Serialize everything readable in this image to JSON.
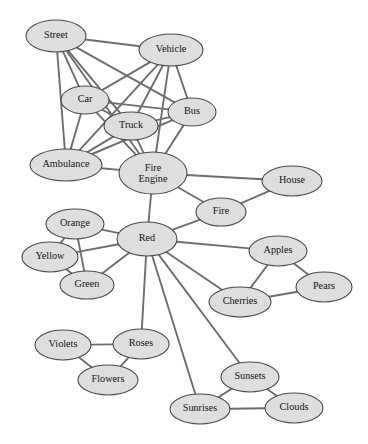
{
  "diagram": {
    "type": "semantic-network-graph",
    "style": {
      "node_fill": "#dedede",
      "node_stroke": "#4a4a4a",
      "edge_color": "#6d6d6d",
      "label_color": "#141414",
      "background": "#ffffff"
    },
    "nodes": [
      {
        "id": "street",
        "label": "Street",
        "x": 56,
        "y": 36,
        "rx": 30,
        "ry": 16
      },
      {
        "id": "vehicle",
        "label": "Vehicle",
        "x": 171,
        "y": 50,
        "rx": 32,
        "ry": 16
      },
      {
        "id": "car",
        "label": "Car",
        "x": 85,
        "y": 100,
        "rx": 24,
        "ry": 14
      },
      {
        "id": "bus",
        "label": "Bus",
        "x": 192,
        "y": 112,
        "rx": 24,
        "ry": 14
      },
      {
        "id": "truck",
        "label": "Truck",
        "x": 131,
        "y": 126,
        "rx": 27,
        "ry": 14
      },
      {
        "id": "ambulance",
        "label": "Ambulance",
        "x": 66,
        "y": 165,
        "rx": 36,
        "ry": 16
      },
      {
        "id": "fire-engine",
        "label": "Fire Engine",
        "x": 153,
        "y": 173,
        "rx": 34,
        "ry": 21
      },
      {
        "id": "house",
        "label": "House",
        "x": 292,
        "y": 181,
        "rx": 30,
        "ry": 15
      },
      {
        "id": "fire",
        "label": "Fire",
        "x": 221,
        "y": 212,
        "rx": 25,
        "ry": 14
      },
      {
        "id": "orange",
        "label": "Orange",
        "x": 75,
        "y": 224,
        "rx": 29,
        "ry": 15
      },
      {
        "id": "red",
        "label": "Red",
        "x": 147,
        "y": 239,
        "rx": 30,
        "ry": 17
      },
      {
        "id": "yellow",
        "label": "Yellow",
        "x": 50,
        "y": 257,
        "rx": 28,
        "ry": 15
      },
      {
        "id": "apples",
        "label": "Apples",
        "x": 278,
        "y": 251,
        "rx": 29,
        "ry": 15
      },
      {
        "id": "green",
        "label": "Green",
        "x": 87,
        "y": 285,
        "rx": 27,
        "ry": 14
      },
      {
        "id": "pears",
        "label": "Pears",
        "x": 324,
        "y": 287,
        "rx": 28,
        "ry": 15
      },
      {
        "id": "cherries",
        "label": "Cherries",
        "x": 240,
        "y": 302,
        "rx": 31,
        "ry": 15
      },
      {
        "id": "violets",
        "label": "Violets",
        "x": 63,
        "y": 345,
        "rx": 28,
        "ry": 15
      },
      {
        "id": "roses",
        "label": "Roses",
        "x": 141,
        "y": 344,
        "rx": 28,
        "ry": 15
      },
      {
        "id": "flowers",
        "label": "Flowers",
        "x": 108,
        "y": 380,
        "rx": 30,
        "ry": 15
      },
      {
        "id": "sunsets",
        "label": "Sunsets",
        "x": 250,
        "y": 377,
        "rx": 29,
        "ry": 15
      },
      {
        "id": "sunrises",
        "label": "Sunrises",
        "x": 200,
        "y": 409,
        "rx": 30,
        "ry": 15
      },
      {
        "id": "clouds",
        "label": "Clouds",
        "x": 294,
        "y": 408,
        "rx": 29,
        "ry": 15
      }
    ],
    "edges": [
      {
        "from": "street",
        "to": "vehicle"
      },
      {
        "from": "street",
        "to": "car"
      },
      {
        "from": "street",
        "to": "truck"
      },
      {
        "from": "street",
        "to": "bus"
      },
      {
        "from": "street",
        "to": "ambulance"
      },
      {
        "from": "street",
        "to": "fire-engine"
      },
      {
        "from": "vehicle",
        "to": "car"
      },
      {
        "from": "vehicle",
        "to": "truck"
      },
      {
        "from": "vehicle",
        "to": "bus"
      },
      {
        "from": "vehicle",
        "to": "ambulance"
      },
      {
        "from": "vehicle",
        "to": "fire-engine"
      },
      {
        "from": "car",
        "to": "bus"
      },
      {
        "from": "car",
        "to": "truck"
      },
      {
        "from": "car",
        "to": "ambulance"
      },
      {
        "from": "car",
        "to": "fire-engine"
      },
      {
        "from": "truck",
        "to": "bus"
      },
      {
        "from": "truck",
        "to": "ambulance"
      },
      {
        "from": "truck",
        "to": "fire-engine"
      },
      {
        "from": "bus",
        "to": "ambulance"
      },
      {
        "from": "bus",
        "to": "fire-engine"
      },
      {
        "from": "ambulance",
        "to": "fire-engine"
      },
      {
        "from": "fire-engine",
        "to": "house"
      },
      {
        "from": "fire-engine",
        "to": "fire"
      },
      {
        "from": "fire-engine",
        "to": "red"
      },
      {
        "from": "house",
        "to": "fire"
      },
      {
        "from": "fire",
        "to": "red"
      },
      {
        "from": "orange",
        "to": "yellow"
      },
      {
        "from": "orange",
        "to": "green"
      },
      {
        "from": "orange",
        "to": "red"
      },
      {
        "from": "yellow",
        "to": "green"
      },
      {
        "from": "yellow",
        "to": "red"
      },
      {
        "from": "green",
        "to": "red"
      },
      {
        "from": "red",
        "to": "apples"
      },
      {
        "from": "red",
        "to": "cherries"
      },
      {
        "from": "red",
        "to": "roses"
      },
      {
        "from": "red",
        "to": "sunsets"
      },
      {
        "from": "red",
        "to": "sunrises"
      },
      {
        "from": "apples",
        "to": "pears"
      },
      {
        "from": "apples",
        "to": "cherries"
      },
      {
        "from": "cherries",
        "to": "pears"
      },
      {
        "from": "violets",
        "to": "roses"
      },
      {
        "from": "violets",
        "to": "flowers"
      },
      {
        "from": "roses",
        "to": "flowers"
      },
      {
        "from": "sunsets",
        "to": "sunrises"
      },
      {
        "from": "sunsets",
        "to": "clouds"
      },
      {
        "from": "sunrises",
        "to": "clouds"
      }
    ]
  }
}
